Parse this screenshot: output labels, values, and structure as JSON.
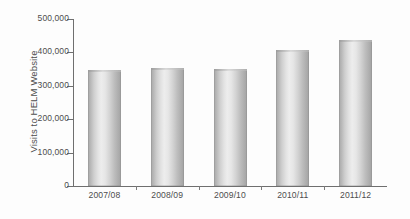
{
  "chart_data": {
    "type": "bar",
    "title": "",
    "subtitle": "",
    "xlabel": "",
    "ylabel": "Visits to HELM Website",
    "categories": [
      "2007/08",
      "2008/09",
      "2009/10",
      "2010/11",
      "2011/12"
    ],
    "values": [
      347000,
      353000,
      349000,
      407000,
      438000
    ],
    "series": [
      {
        "name": "Visits to HELM Website",
        "values": [
          347000,
          353000,
          349000,
          407000,
          438000
        ]
      }
    ],
    "ylim": [
      0,
      500000
    ],
    "yticks": [
      0,
      100000,
      200000,
      300000,
      400000,
      500000
    ],
    "ytick_labels": [
      "0",
      "100,000",
      "200,000",
      "300,000",
      "400,000",
      "500,000"
    ],
    "grid": false,
    "legend": false,
    "legend_position": "none",
    "bar_style": "cylinder",
    "bar_color": "#cfcfcf",
    "axis_color": "#6f6f6f",
    "background_color": "#fdfdfd",
    "annotations": []
  }
}
